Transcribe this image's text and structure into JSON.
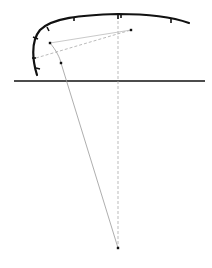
{
  "diagram": {
    "background": "#ffffff",
    "stroke_color": "#111111",
    "thin_color": "#999999",
    "ground_line": {
      "x1": 14,
      "y1": 81,
      "x2": 205,
      "y2": 81
    },
    "profile_curve": "M37,75 C33,62 30,42 40,30 C52,18 80,15 118,14 C150,14 175,18 189,23",
    "ticks": [
      {
        "x1": 47,
        "y1": 27,
        "x2": 49,
        "y2": 31
      },
      {
        "x1": 74,
        "y1": 17,
        "x2": 74,
        "y2": 21
      },
      {
        "x1": 118,
        "y1": 14,
        "x2": 118,
        "y2": 19
      },
      {
        "x1": 121,
        "y1": 14,
        "x2": 121,
        "y2": 18
      },
      {
        "x1": 171,
        "y1": 19,
        "x2": 171,
        "y2": 23
      },
      {
        "x1": 33,
        "y1": 37,
        "x2": 38,
        "y2": 39
      },
      {
        "x1": 32,
        "y1": 58,
        "x2": 36,
        "y2": 58
      },
      {
        "x1": 36,
        "y1": 68,
        "x2": 40,
        "y2": 69
      }
    ],
    "vertical_dashed": {
      "x1": 118,
      "y1": 16,
      "x2": 118,
      "y2": 250
    },
    "solid_thin_line": {
      "x1": 50,
      "y1": 43,
      "x2": 131,
      "y2": 30
    },
    "dashed_line": {
      "x1": 36,
      "y1": 58,
      "x2": 131,
      "y2": 30
    },
    "long_line": "M50,43 C56,50 60,58 61,63 L118,248",
    "points": [
      {
        "name": "point-a",
        "x": 50,
        "y": 43
      },
      {
        "name": "point-b",
        "x": 131,
        "y": 30
      },
      {
        "name": "point-c",
        "x": 61,
        "y": 63
      },
      {
        "name": "point-d",
        "x": 118,
        "y": 248
      }
    ]
  }
}
